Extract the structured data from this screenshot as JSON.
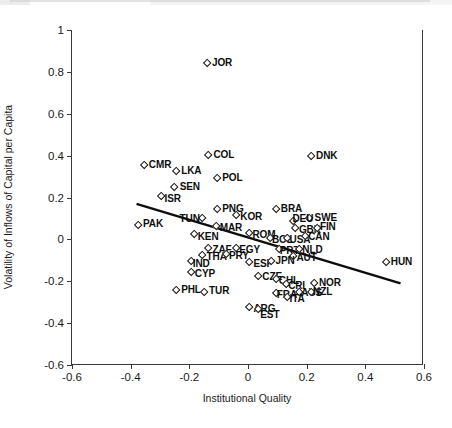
{
  "chart_data": {
    "type": "scatter",
    "title": "",
    "xlabel": "Institutional Quality",
    "ylabel": "Volatility of Inflows of Capital per Capita",
    "xlim": [
      -0.6,
      0.6
    ],
    "ylim": [
      -0.6,
      1.0
    ],
    "xticks": [
      "-0.6",
      "-0.4",
      "-0.2",
      "0",
      "0.2",
      "0.4",
      "0.6"
    ],
    "xtick_values": [
      -0.6,
      -0.4,
      -0.2,
      0,
      0.2,
      0.4,
      0.6
    ],
    "yticks": [
      "1",
      "0.8",
      "0.6",
      "0.4",
      "0.2",
      "0",
      "-0.2",
      "-0.4",
      "-0.6"
    ],
    "ytick_values": [
      1,
      0.8,
      0.6,
      0.4,
      0.2,
      0,
      -0.2,
      -0.4,
      -0.6
    ],
    "grid": false,
    "legend": null,
    "marker": "open-diamond",
    "trendline": {
      "type": "linear-fit",
      "x_start": -0.38,
      "y_start": 0.17,
      "x_end": 0.52,
      "y_end": -0.21
    },
    "points": [
      {
        "label": "JOR",
        "x": -0.14,
        "y": 0.84,
        "label_dx": 5,
        "label_dy": -6.5
      },
      {
        "label": "COL",
        "x": -0.135,
        "y": 0.4,
        "label_dx": 5,
        "label_dy": -6.5
      },
      {
        "label": "DNK",
        "x": 0.215,
        "y": 0.395,
        "label_dx": 5,
        "label_dy": -6.5
      },
      {
        "label": "CMR",
        "x": -0.355,
        "y": 0.355,
        "label_dx": 5,
        "label_dy": -6.5
      },
      {
        "label": "LKA",
        "x": -0.245,
        "y": 0.325,
        "label_dx": 5,
        "label_dy": -6.5
      },
      {
        "label": "POL",
        "x": -0.105,
        "y": 0.29,
        "label_dx": 5,
        "label_dy": -6.5
      },
      {
        "label": "SEN",
        "x": -0.25,
        "y": 0.25,
        "label_dx": 5,
        "label_dy": -6.5
      },
      {
        "label": "ISR",
        "x": -0.295,
        "y": 0.205,
        "label_dx": 3,
        "label_dy": -3
      },
      {
        "label": "PNG",
        "x": -0.105,
        "y": 0.145,
        "label_dx": 5,
        "label_dy": -6.5
      },
      {
        "label": "BRA",
        "x": 0.095,
        "y": 0.145,
        "label_dx": 5,
        "label_dy": -6.5
      },
      {
        "label": "KOR",
        "x": -0.04,
        "y": 0.115,
        "label_dx": 4,
        "label_dy": -4
      },
      {
        "label": "TUN",
        "x": -0.155,
        "y": 0.1,
        "label_dx": -23,
        "label_dy": -5
      },
      {
        "label": "SWE",
        "x": 0.21,
        "y": 0.1,
        "label_dx": 5,
        "label_dy": -6.5
      },
      {
        "label": "DEU",
        "x": 0.155,
        "y": 0.085,
        "label_dx": -1,
        "label_dy": -9
      },
      {
        "label": "PAK",
        "x": -0.375,
        "y": 0.07,
        "label_dx": 5,
        "label_dy": -6.5
      },
      {
        "label": "MAR",
        "x": -0.11,
        "y": 0.065,
        "label_dx": 4,
        "label_dy": -4
      },
      {
        "label": "GBR",
        "x": 0.16,
        "y": 0.055,
        "label_dx": 4,
        "label_dy": -4
      },
      {
        "label": "FIN",
        "x": 0.235,
        "y": 0.055,
        "label_dx": 3,
        "label_dy": -6.5
      },
      {
        "label": "ROM",
        "x": 0.005,
        "y": 0.03,
        "label_dx": 3,
        "label_dy": -4
      },
      {
        "label": "KEN",
        "x": -0.185,
        "y": 0.025,
        "label_dx": 4,
        "label_dy": -3
      },
      {
        "label": "BOL",
        "x": 0.075,
        "y": 0.005,
        "label_dx": 2,
        "label_dy": -4
      },
      {
        "label": "USA",
        "x": 0.135,
        "y": 0.005,
        "label_dx": 2,
        "label_dy": -4
      },
      {
        "label": "CAN",
        "x": 0.195,
        "y": 0.015,
        "label_dx": 3,
        "label_dy": -5
      },
      {
        "label": "ZAF",
        "x": -0.135,
        "y": -0.04,
        "label_dx": 4,
        "label_dy": -4
      },
      {
        "label": "EGY",
        "x": -0.04,
        "y": -0.04,
        "label_dx": 3,
        "label_dy": -4
      },
      {
        "label": "PRT",
        "x": 0.105,
        "y": -0.045,
        "label_dx": 1,
        "label_dy": -4
      },
      {
        "label": "NLD",
        "x": 0.175,
        "y": -0.045,
        "label_dx": 3,
        "label_dy": -5
      },
      {
        "label": "THA",
        "x": -0.155,
        "y": -0.075,
        "label_dx": 4,
        "label_dy": -4
      },
      {
        "label": "PRY",
        "x": -0.075,
        "y": -0.07,
        "label_dx": 3,
        "label_dy": -4
      },
      {
        "label": "AUT",
        "x": 0.155,
        "y": -0.08,
        "label_dx": 3,
        "label_dy": -4
      },
      {
        "label": "IND",
        "x": -0.195,
        "y": -0.105,
        "label_dx": 2,
        "label_dy": -3
      },
      {
        "label": "ESP",
        "x": 0.005,
        "y": -0.11,
        "label_dx": 4,
        "label_dy": -4
      },
      {
        "label": "JPN",
        "x": 0.08,
        "y": -0.105,
        "label_dx": 4,
        "label_dy": -6.5
      },
      {
        "label": "HUN",
        "x": 0.47,
        "y": -0.11,
        "label_dx": 5,
        "label_dy": -6.5
      },
      {
        "label": "CYP",
        "x": -0.195,
        "y": -0.155,
        "label_dx": 4,
        "label_dy": -4
      },
      {
        "label": "CZE",
        "x": 0.035,
        "y": -0.175,
        "label_dx": 4,
        "label_dy": -5
      },
      {
        "label": "CHL",
        "x": 0.095,
        "y": -0.19,
        "label_dx": 3,
        "label_dy": -4
      },
      {
        "label": "CRI",
        "x": 0.13,
        "y": -0.215,
        "label_dx": 2,
        "label_dy": -4
      },
      {
        "label": "NOR",
        "x": 0.225,
        "y": -0.21,
        "label_dx": 5,
        "label_dy": -6.5
      },
      {
        "label": "PHL",
        "x": -0.245,
        "y": -0.245,
        "label_dx": 5,
        "label_dy": -6.5
      },
      {
        "label": "TUR",
        "x": -0.15,
        "y": -0.25,
        "label_dx": 5,
        "label_dy": -6.5
      },
      {
        "label": "FRA",
        "x": 0.095,
        "y": -0.255,
        "label_dx": 1,
        "label_dy": -4
      },
      {
        "label": "AUS",
        "x": 0.175,
        "y": -0.25,
        "label_dx": 2,
        "label_dy": -5
      },
      {
        "label": "NZL",
        "x": 0.215,
        "y": -0.25,
        "label_dx": 2,
        "label_dy": -6
      },
      {
        "label": "ITA",
        "x": 0.135,
        "y": -0.275,
        "label_dx": 2,
        "label_dy": -4
      },
      {
        "label": "ARG",
        "x": 0.005,
        "y": -0.325,
        "label_dx": 4,
        "label_dy": -4
      },
      {
        "label": "EST",
        "x": 0.035,
        "y": -0.335,
        "label_dx": 2,
        "label_dy": -1
      }
    ]
  },
  "caption": ""
}
